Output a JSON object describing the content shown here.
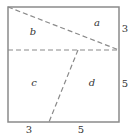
{
  "diagram": {
    "type": "geometry",
    "colors": {
      "border": "#8a8a8a",
      "dashed": "#8a8a8a",
      "text": "#333333",
      "background": "#ffffff"
    },
    "regions": [
      {
        "id": "a",
        "label": "a"
      },
      {
        "id": "b",
        "label": "b"
      },
      {
        "id": "c",
        "label": "c"
      },
      {
        "id": "d",
        "label": "d"
      }
    ],
    "dimensions": {
      "right_upper": "3",
      "right_lower": "5",
      "bottom_left": "3",
      "bottom_right": "5"
    }
  }
}
